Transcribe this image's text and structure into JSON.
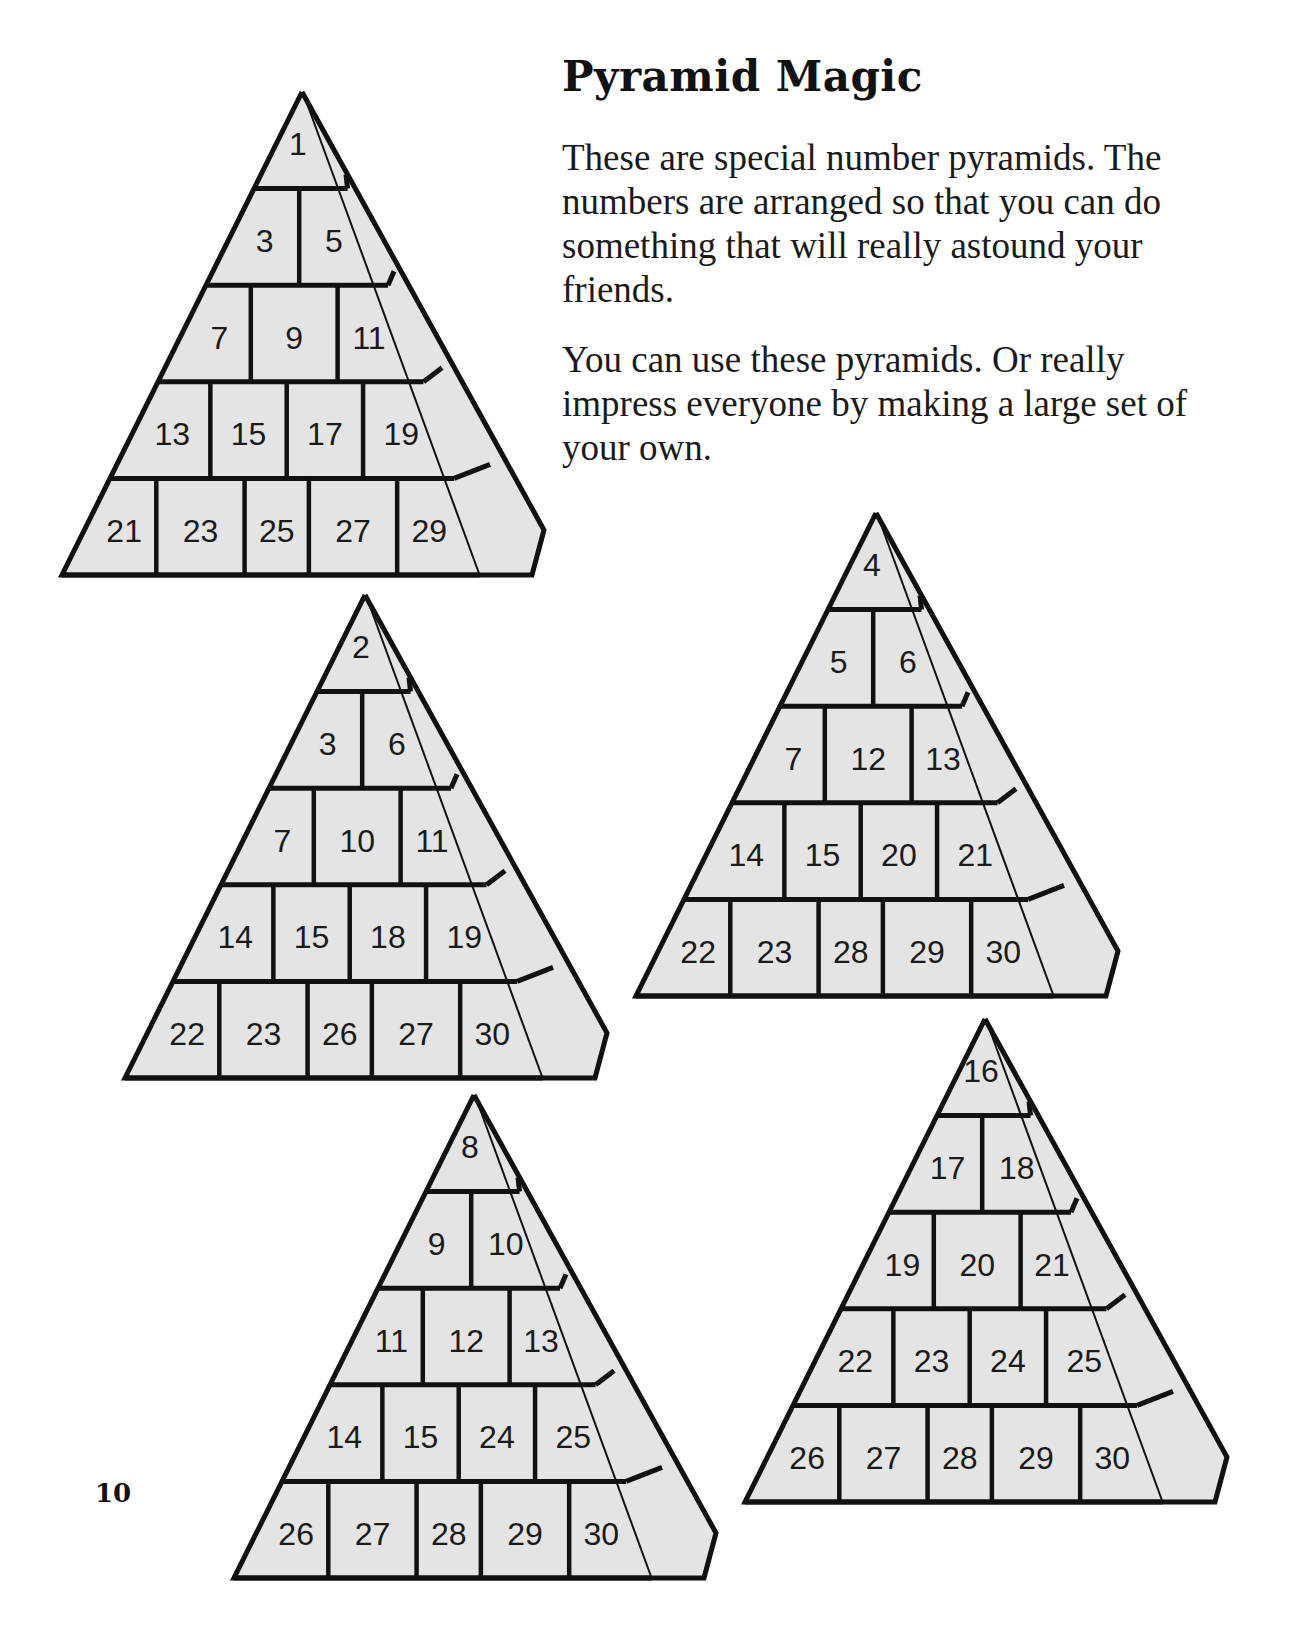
{
  "page": {
    "title": "Pyramid Magic",
    "paragraphs": [
      "These are special number pyramids. The numbers are arranged so that you can do something that will really astound your friends.",
      "You can use these pyramids.  Or really impress everyone by making a large set of your own."
    ],
    "page_number": "10"
  },
  "colors": {
    "block_fill": "#e4e4e4",
    "outline": "#111111",
    "text": "#1a1a1a"
  },
  "pyramids": [
    {
      "key": "1",
      "apex": [
        302,
        92
      ],
      "base_y": 575,
      "half_width": 240,
      "rows": [
        [
          "1"
        ],
        [
          "3",
          "5"
        ],
        [
          "7",
          "9",
          "11"
        ],
        [
          "13",
          "15",
          "17",
          "19"
        ],
        [
          "21",
          "23",
          "25",
          "27",
          "29"
        ]
      ]
    },
    {
      "key": "2",
      "apex": [
        365,
        595
      ],
      "base_y": 1078,
      "half_width": 240,
      "rows": [
        [
          "2"
        ],
        [
          "3",
          "6"
        ],
        [
          "7",
          "10",
          "11"
        ],
        [
          "14",
          "15",
          "18",
          "19"
        ],
        [
          "22",
          "23",
          "26",
          "27",
          "30"
        ]
      ]
    },
    {
      "key": "4",
      "apex": [
        876,
        513
      ],
      "base_y": 996,
      "half_width": 240,
      "rows": [
        [
          "4"
        ],
        [
          "5",
          "6"
        ],
        [
          "7",
          "12",
          "13"
        ],
        [
          "14",
          "15",
          "20",
          "21"
        ],
        [
          "22",
          "23",
          "28",
          "29",
          "30"
        ]
      ]
    },
    {
      "key": "8",
      "apex": [
        474,
        1095
      ],
      "base_y": 1578,
      "half_width": 240,
      "rows": [
        [
          "8"
        ],
        [
          "9",
          "10"
        ],
        [
          "11",
          "12",
          "13"
        ],
        [
          "14",
          "15",
          "24",
          "25"
        ],
        [
          "26",
          "27",
          "28",
          "29",
          "30"
        ]
      ]
    },
    {
      "key": "16",
      "apex": [
        985,
        1019
      ],
      "base_y": 1502,
      "half_width": 240,
      "rows": [
        [
          "16"
        ],
        [
          "17",
          "18"
        ],
        [
          "19",
          "20",
          "21"
        ],
        [
          "22",
          "23",
          "24",
          "25"
        ],
        [
          "26",
          "27",
          "28",
          "29",
          "30"
        ]
      ]
    }
  ]
}
